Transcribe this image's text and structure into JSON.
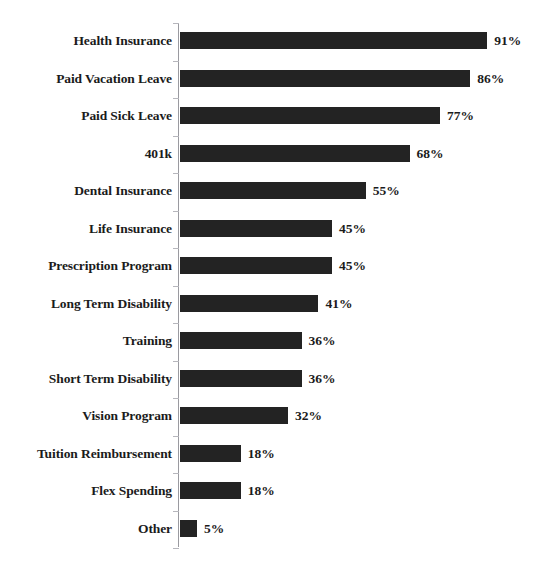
{
  "chart_data": {
    "type": "bar",
    "orientation": "horizontal",
    "title": "",
    "xlabel": "",
    "ylabel": "",
    "xlim": [
      0,
      100
    ],
    "grid": false,
    "legend": null,
    "value_suffix": "%",
    "bar_color": "#232323",
    "axis_color": "#9a9aa0",
    "background": "#ffffff",
    "categories": [
      "Health Insurance",
      "Paid Vacation Leave",
      "Paid Sick Leave",
      "401k",
      "Dental Insurance",
      "Life Insurance",
      "Prescription Program",
      "Long Term Disability",
      "Training",
      "Short Term Disability",
      "Vision Program",
      "Tuition Reimbursement",
      "Flex Spending",
      "Other"
    ],
    "values": [
      91,
      86,
      77,
      68,
      55,
      45,
      45,
      41,
      36,
      36,
      32,
      18,
      18,
      5
    ],
    "data_labels": [
      "91%",
      "86%",
      "77%",
      "68%",
      "55%",
      "45%",
      "45%",
      "41%",
      "36%",
      "36%",
      "32%",
      "18%",
      "18%",
      "5%"
    ]
  }
}
